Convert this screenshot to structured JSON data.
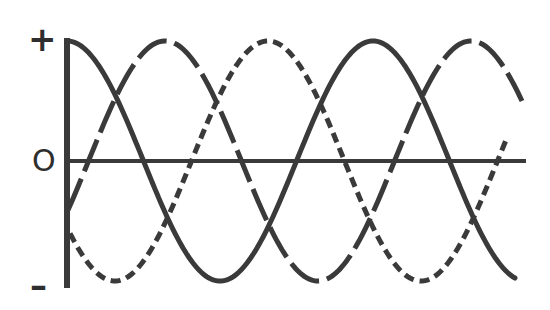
{
  "diagram": {
    "title": "",
    "labels": {
      "plus": "+",
      "zero": "O",
      "minus": "–"
    },
    "colors": {
      "ink": "#3a3a3a",
      "background": "#ffffff"
    }
  },
  "chart_data": {
    "type": "line",
    "title": "",
    "xlabel": "",
    "ylabel": "",
    "y_tick_labels": [
      "+",
      "O",
      "–"
    ],
    "grid": false,
    "legend": null,
    "axis_px": {
      "x0": 67,
      "x_end": 526,
      "y_zero": 161,
      "y_top": 40,
      "y_bottom": 287
    },
    "amplitude_px": 120,
    "period_px": 306,
    "series": [
      {
        "name": "phase-solid",
        "style": "solid",
        "phase_deg": 90,
        "x_start": 67,
        "x_end": 516,
        "peaks_x": [
          67,
          370
        ],
        "troughs_x": [
          215,
          520
        ],
        "zero_crossings_x": [
          138,
          292,
          445
        ]
      },
      {
        "name": "phase-long-dash",
        "style": "long-dash",
        "phase_deg": -30,
        "x_start": 68,
        "x_end": 522,
        "peaks_x": [
          165,
          470
        ],
        "troughs_x": [
          318
        ],
        "zero_crossings_x": [
          88,
          240,
          393
        ]
      },
      {
        "name": "phase-short-dash",
        "style": "short-dash",
        "phase_deg": 210,
        "x_start": 70,
        "x_end": 506,
        "peaks_x": [
          268
        ],
        "troughs_x": [
          115,
          420
        ],
        "zero_crossings_x": [
          192,
          343,
          500
        ]
      }
    ]
  }
}
